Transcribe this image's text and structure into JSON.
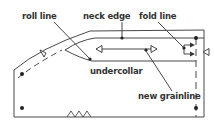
{
  "diagram": {
    "type": "pattern-piece",
    "labels": {
      "roll_line": "roll line",
      "neck_edge": "neck edge",
      "fold_line": "fold line",
      "undercollar": "undercollar",
      "new_grainline": "new grainline"
    },
    "colors": {
      "line": "#333333",
      "background": "#ffffff"
    }
  }
}
